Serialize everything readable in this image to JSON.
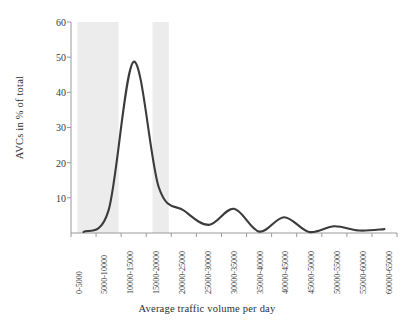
{
  "chart_data": {
    "type": "line",
    "title": "",
    "xlabel": "Average traffic volume per day",
    "ylabel": "AVCs in % of total",
    "categories": [
      "0-5000",
      "5000-10000",
      "10000-15000",
      "15000-20000",
      "20000-25000",
      "25000-30000",
      "30000-35000",
      "35000-40000",
      "40000-45000",
      "45000-50000",
      "50000-55000",
      "55000-60000",
      "60000-65000"
    ],
    "values": [
      0.3,
      6.5,
      48.7,
      13.0,
      6.4,
      2.3,
      6.9,
      0.4,
      4.5,
      0.3,
      1.9,
      0.7,
      1.1
    ],
    "ylim": [
      0,
      60
    ],
    "yticks": [
      10,
      20,
      30,
      40,
      50,
      60
    ],
    "ytick_labels": [
      "10",
      "20",
      "30",
      "40",
      "50",
      "60"
    ],
    "grid": false,
    "legend": "none",
    "series_color": "#3b3b3b",
    "highlight_band_color": "#ececec",
    "axis_color": "#9a9a9a",
    "highlight_bands": [
      {
        "from_category": "0-5000",
        "to_category": "5000-10000"
      },
      {
        "from_category": "15000-20000",
        "to_category": "15000-20000"
      }
    ],
    "annotations": []
  }
}
